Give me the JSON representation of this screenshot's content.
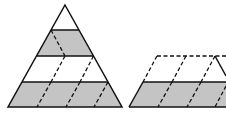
{
  "figure": {
    "colors": {
      "shade": "#c4c4c4",
      "stroke": "#111111",
      "background": "#ffffff"
    },
    "triangle": {
      "apex": [
        65,
        5
      ],
      "base_left": [
        8,
        107
      ],
      "base_right": [
        122,
        107
      ],
      "levels_y": [
        30,
        56,
        82,
        107
      ],
      "shaded_rows": [
        1,
        3
      ]
    },
    "trapezoid": {
      "top_y": 56,
      "mid_y": 82,
      "bottom_y": 107,
      "shaded_rows": [
        1
      ]
    }
  }
}
